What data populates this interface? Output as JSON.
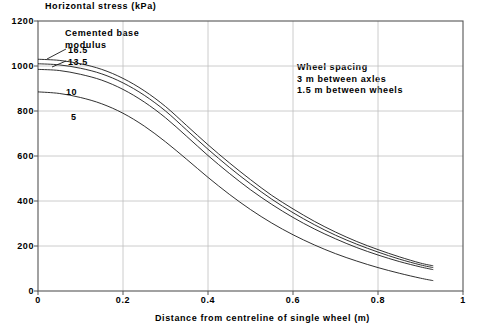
{
  "chart_data": {
    "type": "line",
    "title": "",
    "ylabel": "Horizontal stress (kPa)",
    "xlabel": "Distance from centreline of single wheel (m)",
    "xlim": [
      0,
      1
    ],
    "ylim": [
      0,
      1200
    ],
    "xticks": [
      "0",
      "0.2",
      "0.4",
      "0.6",
      "0.8",
      "1"
    ],
    "yticks": [
      "0",
      "200",
      "400",
      "600",
      "800",
      "1000",
      "1200"
    ],
    "grid": true,
    "legend_position": "inline-curve-labels",
    "series": [
      {
        "name": "16.5",
        "label": "16.5",
        "x": [
          0,
          0.05,
          0.1,
          0.15,
          0.2,
          0.25,
          0.3,
          0.35,
          0.4,
          0.45,
          0.5,
          0.55,
          0.6,
          0.65,
          0.7,
          0.75,
          0.8,
          0.85,
          0.9,
          0.93
        ],
        "values": [
          1030,
          1025,
          1010,
          985,
          945,
          890,
          820,
          735,
          650,
          570,
          495,
          425,
          365,
          310,
          262,
          220,
          184,
          152,
          124,
          112
        ]
      },
      {
        "name": "13.5",
        "label": "13.5",
        "x": [
          0,
          0.05,
          0.1,
          0.15,
          0.2,
          0.25,
          0.3,
          0.35,
          0.4,
          0.45,
          0.5,
          0.55,
          0.6,
          0.65,
          0.7,
          0.75,
          0.8,
          0.85,
          0.9,
          0.93
        ],
        "values": [
          1010,
          1005,
          990,
          965,
          925,
          870,
          800,
          715,
          630,
          550,
          476,
          408,
          348,
          295,
          248,
          208,
          173,
          142,
          116,
          104
        ]
      },
      {
        "name": "10",
        "label": "10",
        "x": [
          0,
          0.05,
          0.1,
          0.15,
          0.2,
          0.25,
          0.3,
          0.35,
          0.4,
          0.45,
          0.5,
          0.55,
          0.6,
          0.65,
          0.7,
          0.75,
          0.8,
          0.85,
          0.9,
          0.93
        ],
        "values": [
          985,
          980,
          963,
          937,
          896,
          840,
          770,
          687,
          602,
          523,
          450,
          385,
          327,
          276,
          232,
          193,
          160,
          131,
          107,
          95
        ]
      },
      {
        "name": "5",
        "label": "5",
        "x": [
          0,
          0.05,
          0.1,
          0.15,
          0.2,
          0.25,
          0.3,
          0.35,
          0.4,
          0.45,
          0.5,
          0.55,
          0.6,
          0.65,
          0.7,
          0.75,
          0.8,
          0.85,
          0.9,
          0.93
        ],
        "values": [
          885,
          878,
          860,
          832,
          790,
          733,
          663,
          585,
          505,
          430,
          362,
          302,
          250,
          205,
          166,
          133,
          104,
          79,
          57,
          46
        ]
      }
    ],
    "annotations": [
      {
        "name": "curve-group-label",
        "lines": [
          "Cemented base",
          "modulus"
        ],
        "x": 0.18,
        "y": 1135
      },
      {
        "name": "wheel-spacing-note",
        "lines": [
          "Wheel spacing",
          "3 m between axles",
          "1.5 m between wheels"
        ],
        "x": 0.69,
        "y": 930
      }
    ]
  },
  "labels": {
    "ytitle": "Horizontal stress (kPa)",
    "xtitle": "Distance from centreline of single wheel (m)",
    "y": {
      "t0": "0",
      "t200": "200",
      "t400": "400",
      "t600": "600",
      "t800": "800",
      "t1000": "1000",
      "t1200": "1200"
    },
    "x": {
      "t0": "0",
      "t02": "0.2",
      "t04": "0.4",
      "t06": "0.6",
      "t08": "0.8",
      "t1": "1"
    },
    "note_group_1": "Cemented base",
    "note_group_2": "modulus",
    "curve_165": "16.5",
    "curve_135": "13.5",
    "curve_10": "10",
    "curve_5": "5",
    "note_wheel_1": "Wheel spacing",
    "note_wheel_2": "3 m between axles",
    "note_wheel_3": "1.5 m between wheels"
  },
  "colors": {
    "frame": "#555555",
    "grid": "#bfbfbf",
    "curve": "#1a1a1a",
    "background": "#ffffff"
  }
}
